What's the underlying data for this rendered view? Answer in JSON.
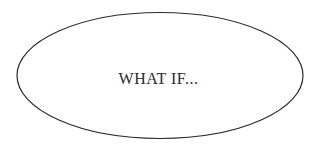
{
  "diagram": {
    "shape": "ellipse",
    "label": "WHAT IF...",
    "colors": {
      "stroke": "#2b2b2b",
      "fill": "#ffffff",
      "text": "#2b2b2b",
      "background": "#ffffff"
    }
  }
}
